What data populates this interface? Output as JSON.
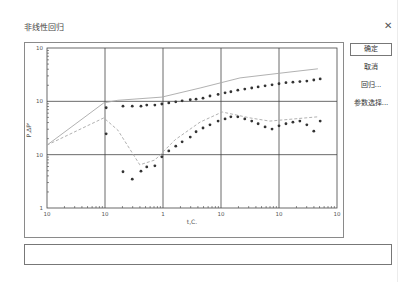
{
  "window": {
    "title": "非线性回归",
    "close_icon": "close-icon"
  },
  "buttons": {
    "ok": "确定",
    "cancel": "取消",
    "regress": "回归...",
    "params": "参数选择..."
  },
  "status": {
    "text": ""
  },
  "chart_data": {
    "type": "scatter",
    "title": "",
    "xlabel": "t,C.",
    "ylabel": "P,ΔP'",
    "xscale": "log",
    "yscale": "log",
    "xlim_log10": [
      -3,
      2
    ],
    "ylim_log10": [
      0,
      3
    ],
    "grid": true,
    "x_tick_labels": [
      "10",
      "10",
      "1",
      "10",
      "10",
      "10"
    ],
    "y_tick_labels": [
      "1",
      "10",
      "10",
      "10"
    ],
    "series": [
      {
        "name": "pressure-fit",
        "style": "solid-line",
        "color": "#a8a8a8",
        "points_log10": [
          [
            -3.0,
            1.18
          ],
          [
            -2.02,
            1.97
          ],
          [
            -1.78,
            2.02
          ],
          [
            -1.02,
            2.08
          ],
          [
            -0.36,
            2.25
          ],
          [
            0.33,
            2.44
          ],
          [
            1.19,
            2.55
          ],
          [
            1.67,
            2.61
          ]
        ]
      },
      {
        "name": "derivative-fit",
        "style": "dashed-line",
        "color": "#a8a8a8",
        "points_log10": [
          [
            -3.0,
            1.18
          ],
          [
            -2.02,
            1.69
          ],
          [
            -1.78,
            1.46
          ],
          [
            -1.4,
            0.81
          ],
          [
            -1.14,
            0.9
          ],
          [
            -0.79,
            1.28
          ],
          [
            -0.36,
            1.61
          ],
          [
            0.02,
            1.8
          ],
          [
            0.5,
            1.69
          ],
          [
            0.84,
            1.63
          ],
          [
            1.67,
            1.71
          ]
        ]
      },
      {
        "name": "pressure-data",
        "style": "markers",
        "color": "#333333",
        "points_log10": [
          [
            -1.98,
            1.88
          ],
          [
            -1.69,
            1.91
          ],
          [
            -1.53,
            1.91
          ],
          [
            -1.38,
            1.91
          ],
          [
            -1.28,
            1.93
          ],
          [
            -1.14,
            1.93
          ],
          [
            -1.02,
            1.95
          ],
          [
            -0.9,
            1.97
          ],
          [
            -0.78,
            1.99
          ],
          [
            -0.67,
            2.01
          ],
          [
            -0.53,
            2.03
          ],
          [
            -0.43,
            2.04
          ],
          [
            -0.31,
            2.06
          ],
          [
            -0.19,
            2.1
          ],
          [
            -0.05,
            2.13
          ],
          [
            0.07,
            2.16
          ],
          [
            0.17,
            2.18
          ],
          [
            0.29,
            2.21
          ],
          [
            0.41,
            2.23
          ],
          [
            0.53,
            2.25
          ],
          [
            0.64,
            2.27
          ],
          [
            0.76,
            2.29
          ],
          [
            0.88,
            2.31
          ],
          [
            1.0,
            2.33
          ],
          [
            1.12,
            2.35
          ],
          [
            1.24,
            2.36
          ],
          [
            1.36,
            2.37
          ],
          [
            1.48,
            2.38
          ],
          [
            1.6,
            2.4
          ],
          [
            1.71,
            2.42
          ]
        ]
      },
      {
        "name": "derivative-data",
        "style": "markers",
        "color": "#333333",
        "points_log10": [
          [
            -1.98,
            1.39
          ],
          [
            -1.69,
            0.68
          ],
          [
            -1.53,
            0.54
          ],
          [
            -1.38,
            0.69
          ],
          [
            -1.28,
            0.77
          ],
          [
            -1.14,
            0.79
          ],
          [
            -1.02,
            0.96
          ],
          [
            -0.9,
            1.07
          ],
          [
            -0.78,
            1.16
          ],
          [
            -0.67,
            1.24
          ],
          [
            -0.53,
            1.33
          ],
          [
            -0.43,
            1.43
          ],
          [
            -0.31,
            1.5
          ],
          [
            -0.19,
            1.56
          ],
          [
            -0.05,
            1.63
          ],
          [
            0.07,
            1.67
          ],
          [
            0.17,
            1.71
          ],
          [
            0.29,
            1.71
          ],
          [
            0.41,
            1.67
          ],
          [
            0.53,
            1.63
          ],
          [
            0.64,
            1.58
          ],
          [
            0.76,
            1.52
          ],
          [
            0.88,
            1.48
          ],
          [
            1.0,
            1.54
          ],
          [
            1.12,
            1.58
          ],
          [
            1.24,
            1.61
          ],
          [
            1.36,
            1.63
          ],
          [
            1.48,
            1.56
          ],
          [
            1.6,
            1.44
          ],
          [
            1.71,
            1.63
          ]
        ]
      }
    ]
  }
}
